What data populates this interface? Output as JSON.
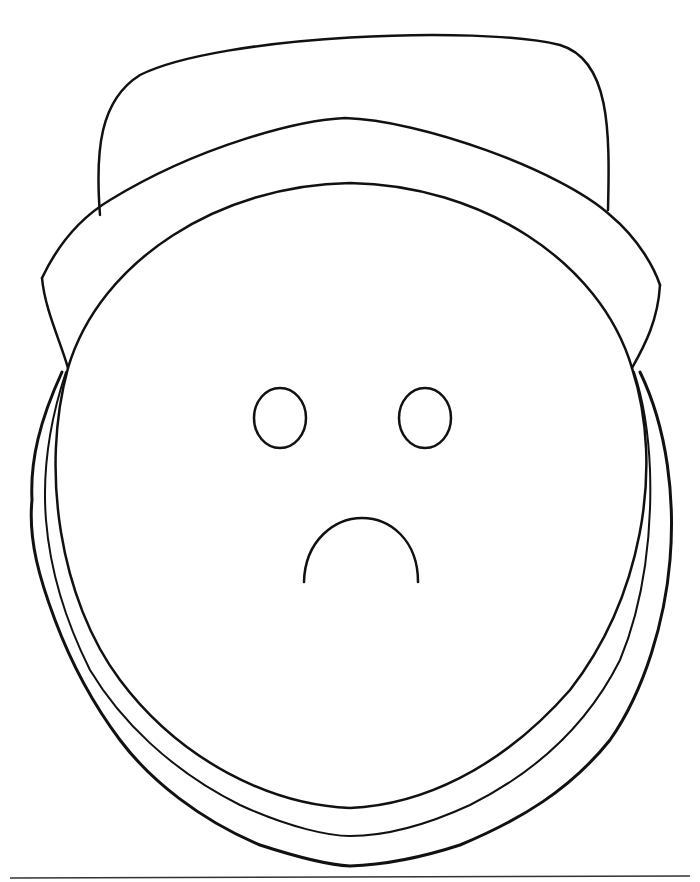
{
  "drawing": {
    "subject": "sad face with hat",
    "stroke_color": "#111111",
    "background": "#ffffff"
  }
}
